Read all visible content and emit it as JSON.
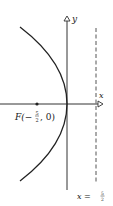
{
  "diagram": {
    "type": "parabola",
    "equation": "y^2 = -10x",
    "opens": "left",
    "vertex": [
      0,
      0
    ],
    "axes": {
      "x_label": "x",
      "y_label": "y"
    },
    "focus": {
      "name": "F",
      "label_prefix": "F(−",
      "frac_num": "5",
      "frac_den": "2",
      "label_suffix": ", 0)",
      "coords": [
        -2.5,
        0
      ]
    },
    "directrix": {
      "label_prefix": "x = ",
      "frac_num": "5",
      "frac_den": "2",
      "value": 2.5,
      "style": "dashed"
    },
    "colors": {
      "curve": "#222222",
      "axes": "#333333",
      "directrix": "#555555",
      "background": "#ffffff"
    }
  }
}
